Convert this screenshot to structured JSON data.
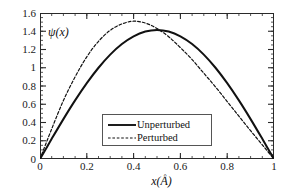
{
  "chart_data": {
    "type": "line",
    "title": "",
    "xlabel": "x(Å)",
    "ylabel": "ψ(x)",
    "inplot_label": "ψ(x)",
    "xlim": [
      0,
      1
    ],
    "ylim": [
      0,
      1.6
    ],
    "xticks": [
      "0",
      "0.2",
      "0.4",
      "0.6",
      "0.8",
      "1"
    ],
    "xtick_values": [
      0,
      0.2,
      0.4,
      0.6,
      0.8,
      1
    ],
    "yticks": [
      "0",
      "0.2",
      "0.4",
      "0.6",
      "0.8",
      "1",
      "1.2",
      "1.4",
      "1.6"
    ],
    "ytick_values": [
      0,
      0.2,
      0.4,
      0.6,
      0.8,
      1,
      1.2,
      1.4,
      1.6
    ],
    "minor_tick_interval_x": 0.05,
    "minor_tick_interval_y": 0.05,
    "grid": false,
    "legend_position": "lower-center",
    "axis_color": "#2a2a2a",
    "series": [
      {
        "name": "Unperturbed",
        "style": "solid",
        "color": "#111111",
        "x": [
          0,
          0.05,
          0.1,
          0.15,
          0.2,
          0.25,
          0.3,
          0.35,
          0.4,
          0.45,
          0.5,
          0.55,
          0.6,
          0.65,
          0.7,
          0.75,
          0.8,
          0.85,
          0.9,
          0.95,
          1
        ],
        "y": [
          0,
          0.221,
          0.437,
          0.642,
          0.831,
          1.0,
          1.144,
          1.26,
          1.345,
          1.397,
          1.414,
          1.397,
          1.345,
          1.26,
          1.144,
          1.0,
          0.831,
          0.642,
          0.437,
          0.221,
          0
        ]
      },
      {
        "name": "Perturbed",
        "style": "dashed",
        "color": "#111111",
        "x": [
          0,
          0.05,
          0.1,
          0.15,
          0.2,
          0.25,
          0.3,
          0.35,
          0.4,
          0.45,
          0.5,
          0.55,
          0.6,
          0.65,
          0.7,
          0.75,
          0.8,
          0.85,
          0.9,
          0.95,
          1
        ],
        "y": [
          0,
          0.33,
          0.64,
          0.9,
          1.12,
          1.29,
          1.41,
          1.48,
          1.51,
          1.49,
          1.43,
          1.34,
          1.22,
          1.09,
          0.94,
          0.79,
          0.63,
          0.47,
          0.31,
          0.155,
          0
        ]
      }
    ]
  },
  "legend": {
    "items": [
      {
        "label": "Unperturbed",
        "style": "solid"
      },
      {
        "label": "Perturbed",
        "style": "dashed"
      }
    ]
  }
}
